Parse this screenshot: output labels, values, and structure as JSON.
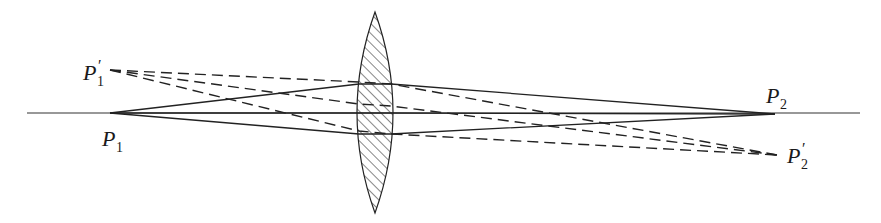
{
  "figure": {
    "title": "",
    "colors": {
      "line": "#222222",
      "background": "#ffffff"
    }
  },
  "optical_axis": {
    "x_start": 27,
    "x_end": 860,
    "y": 113
  },
  "lens": {
    "center_x": 375,
    "top_y": 12,
    "bottom_y": 213,
    "half_width": 18,
    "fill": "hatched"
  },
  "points": {
    "P1": {
      "label": "P",
      "subscript": "1",
      "prime": "",
      "x": 110,
      "y": 113
    },
    "P1_prime": {
      "label": "P",
      "subscript": "1",
      "prime": "′",
      "x": 110,
      "y": 70
    },
    "P2": {
      "label": "P",
      "subscript": "2",
      "prime": "",
      "x": 775,
      "y": 114
    },
    "P2_prime": {
      "label": "P",
      "subscript": "2",
      "prime": "′",
      "x": 777,
      "y": 155
    }
  },
  "rays": {
    "solid": [
      {
        "from": "P1",
        "lens_y_in": 84,
        "lens_y_out": 84,
        "to": "P2"
      },
      {
        "from": "P1",
        "lens_y_in": 113,
        "lens_y_out": 113,
        "to": "P2"
      },
      {
        "from": "P1",
        "lens_y_in": 134,
        "lens_y_out": 134,
        "to": "P2"
      }
    ],
    "dashed": [
      {
        "from": "P1_prime",
        "lens_y_in": 82,
        "lens_y_out": 84,
        "to": "P2_prime"
      },
      {
        "from": "P1_prime",
        "lens_y_in": 104,
        "lens_y_out": 106,
        "to": "P2_prime"
      },
      {
        "from": "P1_prime",
        "lens_y_in": 131,
        "lens_y_out": 134,
        "to": "P2_prime"
      }
    ]
  }
}
